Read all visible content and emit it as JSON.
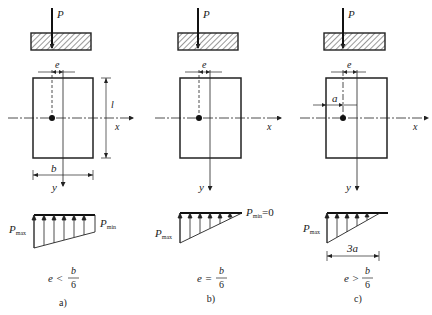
{
  "figure": {
    "panels": [
      {
        "id": "a",
        "load_label": "P",
        "eccentricity_label": "e",
        "length_label": "l",
        "width_label": "b",
        "x_axis_label": "x",
        "y_axis_label": "y",
        "pmax_label": "P",
        "pmax_sub": "max",
        "pmin_label": "P",
        "pmin_sub": "min",
        "condition_lhs": "e <",
        "condition_num": "b",
        "condition_den": "6",
        "caption": "a)"
      },
      {
        "id": "b",
        "load_label": "P",
        "eccentricity_label": "e",
        "x_axis_label": "x",
        "y_axis_label": "y",
        "pmax_label": "P",
        "pmax_sub": "max",
        "pmin_label": "P",
        "pmin_sub": "min",
        "pmin_value": "=0",
        "condition_lhs": "e =",
        "condition_num": "b",
        "condition_den": "6",
        "caption": "b)"
      },
      {
        "id": "c",
        "load_label": "P",
        "eccentricity_label": "e",
        "a_label": "a",
        "x_axis_label": "x",
        "y_axis_label": "y",
        "pmax_label": "P",
        "pmax_sub": "max",
        "contact_length_label": "3a",
        "condition_lhs": "e >",
        "condition_num": "b",
        "condition_den": "6",
        "caption": "c)"
      }
    ]
  }
}
